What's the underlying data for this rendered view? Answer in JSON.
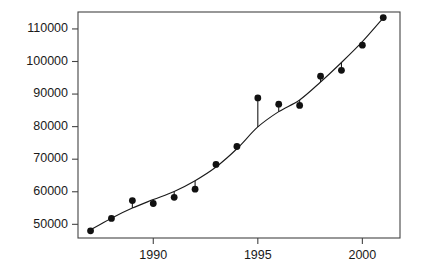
{
  "chart_data": {
    "type": "scatter",
    "title": "",
    "subtitle": "",
    "xlabel": "",
    "ylabel": "",
    "x": [
      1987,
      1988,
      1989,
      1990,
      1991,
      1992,
      1993,
      1994,
      1995,
      1996,
      1997,
      1998,
      1999,
      2000,
      2001
    ],
    "values": [
      48000,
      51800,
      57300,
      56400,
      58300,
      60800,
      68400,
      73900,
      88800,
      86900,
      86500,
      95500,
      97300,
      105000,
      113500
    ],
    "series": [
      {
        "name": "observed",
        "type": "scatter",
        "values": [
          48000,
          51800,
          57300,
          56400,
          58300,
          60800,
          68400,
          73900,
          88800,
          86900,
          86500,
          95500,
          97300,
          105000,
          113500
        ]
      },
      {
        "name": "fitted",
        "type": "line",
        "values": [
          48300,
          51900,
          55000,
          57600,
          60100,
          63400,
          67600,
          73200,
          79900,
          84600,
          88200,
          93700,
          99700,
          106100,
          113400
        ]
      }
    ],
    "residual_lines": true,
    "xlim": [
      1986.4,
      2001.8
    ],
    "ylim": [
      45800,
      115200
    ],
    "xticks": [
      1990,
      1995,
      2000
    ],
    "xtick_labels": [
      "1990",
      "1995",
      "2000"
    ],
    "yticks": [
      50000,
      60000,
      70000,
      80000,
      90000,
      100000,
      110000
    ],
    "ytick_labels": [
      "50000",
      "60000",
      "70000",
      "80000",
      "90000",
      "100000",
      "110000"
    ],
    "grid": false,
    "legend": null,
    "legend_position": "none",
    "annotations": []
  },
  "style": {
    "point_color": "#111111",
    "line_color": "#1a1a1a",
    "axis_color": "#444444",
    "background": "#ffffff",
    "point_radius": 3.4
  },
  "plot_box": {
    "left": 78,
    "right": 400,
    "top": 12,
    "bottom": 238
  }
}
